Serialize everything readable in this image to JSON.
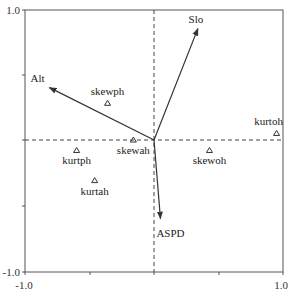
{
  "chart_data": {
    "type": "scatter",
    "subtype": "biplot",
    "title": "",
    "xlabel": "",
    "ylabel": "",
    "xlim": [
      -1.0,
      1.0
    ],
    "ylim": [
      -1.0,
      1.0
    ],
    "grid": false,
    "legend": null,
    "axis_tick_labels": {
      "x_min": "-1.0",
      "x_max": "1.0",
      "y_min": "-1.0",
      "y_max": "1.0"
    },
    "reference_lines": [
      {
        "orientation": "horizontal",
        "value": 0.0,
        "style": "dashed"
      },
      {
        "orientation": "vertical",
        "value": 0.0,
        "style": "dashed"
      }
    ],
    "vectors": [
      {
        "name": "Slo",
        "x": 0.34,
        "y": 0.85
      },
      {
        "name": "Alt",
        "x": -0.81,
        "y": 0.4
      },
      {
        "name": "ASPD",
        "x": 0.05,
        "y": -0.6
      }
    ],
    "points": [
      {
        "name": "skewph",
        "x": -0.36,
        "y": 0.28,
        "marker": "triangle-open"
      },
      {
        "name": "skewah",
        "x": -0.16,
        "y": 0.0,
        "marker": "triangle-open"
      },
      {
        "name": "kurtph",
        "x": -0.6,
        "y": -0.08,
        "marker": "triangle-open"
      },
      {
        "name": "kurtah",
        "x": -0.46,
        "y": -0.31,
        "marker": "triangle-open"
      },
      {
        "name": "skewoh",
        "x": 0.43,
        "y": -0.08,
        "marker": "triangle-open"
      },
      {
        "name": "kurtoh",
        "x": 0.95,
        "y": 0.05,
        "marker": "triangle-open"
      }
    ],
    "colors": {
      "axis": "#555555",
      "arrow": "#333333",
      "marker": "#333333",
      "text": "#222222"
    }
  }
}
